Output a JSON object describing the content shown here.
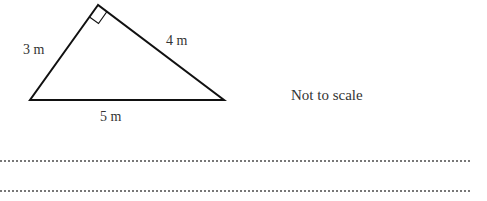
{
  "figure": {
    "shape": "right-triangle",
    "sides": {
      "left": "3 m",
      "right": "4 m",
      "base": "5 m"
    },
    "right_angle_at": "apex"
  },
  "note": "Not to scale",
  "answer_lines": 2
}
